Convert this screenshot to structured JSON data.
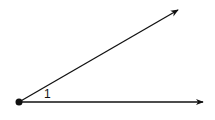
{
  "diagram": {
    "type": "angle",
    "angle_label": "1",
    "vertex": {
      "x": 19,
      "y": 102
    },
    "rays": [
      {
        "name": "upper-ray",
        "end": {
          "x": 178,
          "y": 10
        }
      },
      {
        "name": "lower-ray",
        "end": {
          "x": 203,
          "y": 102
        }
      }
    ],
    "colors": {
      "stroke": "#111111",
      "background": "#ffffff"
    }
  }
}
